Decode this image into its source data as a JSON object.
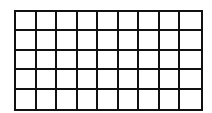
{
  "grid": {
    "rows": 5,
    "columns": 9,
    "line_color": "#111111",
    "fill_color": "#ffffff",
    "shaded_cells": []
  }
}
